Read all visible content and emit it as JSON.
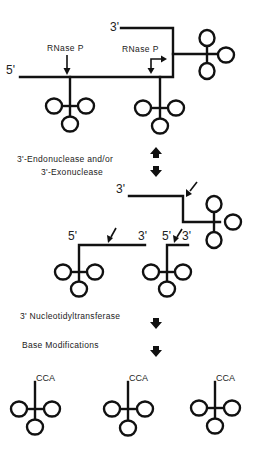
{
  "section1": {
    "five_prime": "5'",
    "three_prime": "3'",
    "enzyme_left": "RNase P",
    "enzyme_right": "RNase P"
  },
  "step1": {
    "line1": "3'-Endonuclease and/or",
    "line2": "3'-Exonuclease"
  },
  "section2": {
    "upper_three_prime": "3'",
    "left_five_prime": "5'",
    "left_three_prime": "3'",
    "mid_five_prime": "5'",
    "mid_three_prime": "3'"
  },
  "step2": {
    "label": "3' Nucleotidyltransferase"
  },
  "step3": {
    "label": "Base Modifications"
  },
  "products": [
    {
      "label": "CCA"
    },
    {
      "label": "CCA"
    },
    {
      "label": "CCA"
    }
  ],
  "colors": {
    "ink": "#111111",
    "background": "#ffffff"
  }
}
